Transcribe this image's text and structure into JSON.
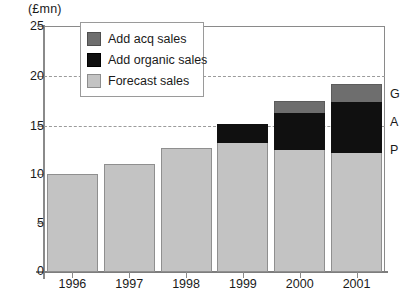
{
  "chart_data": {
    "type": "bar",
    "subtype": "stacked-bar",
    "title": "",
    "xlabel": "",
    "ylabel": "(£mn)",
    "y_unit_caption": "(£mn)",
    "categories": [
      "1996",
      "1997",
      "1998",
      "1999",
      "2000",
      "2001"
    ],
    "series": [
      {
        "name": "Forecast sales",
        "values": [
          10.0,
          11.0,
          12.6,
          13.1,
          12.4,
          12.1
        ],
        "color": "#c3c3c3"
      },
      {
        "name": "Add organic sales",
        "values": [
          0,
          0,
          0,
          1.9,
          3.8,
          5.2
        ],
        "color": "#101010"
      },
      {
        "name": "Add acq sales",
        "values": [
          0,
          0,
          0,
          0,
          1.2,
          1.8
        ],
        "color": "#6e6e6e"
      }
    ],
    "totals": [
      10.0,
      11.0,
      12.6,
      15.0,
      17.4,
      19.1
    ],
    "ylim": [
      0,
      25
    ],
    "yticks": [
      0,
      5,
      10,
      15,
      20,
      25
    ],
    "ytick_labels": [
      "0",
      "5",
      "10",
      "15",
      "20",
      "25"
    ],
    "gridlines_at": [
      15,
      20
    ],
    "grid": "dashed-horizontal-partial",
    "legend_position": "top-left-inside",
    "annotations": [
      {
        "text": "G",
        "value": 19.1,
        "note": "gap bracket letter"
      },
      {
        "text": "A",
        "value": 17.4,
        "note": "gap bracket letter"
      },
      {
        "text": "P",
        "value": 15.5,
        "note": "gap bracket letter"
      }
    ]
  },
  "legend": {
    "items": [
      {
        "label": "Add acq sales",
        "swatch": "dark-gray-swatch"
      },
      {
        "label": "Add organic sales",
        "swatch": "black-swatch"
      },
      {
        "label": "Forecast sales",
        "swatch": "light-gray-swatch"
      }
    ]
  },
  "axes": {
    "y_caption": "(£mn)",
    "y_ticks": [
      "25",
      "20",
      "15",
      "10",
      "5",
      "0"
    ],
    "x_ticks": [
      "1996",
      "1997",
      "1998",
      "1999",
      "2000",
      "2001"
    ]
  },
  "gap_annotation": {
    "letters": [
      "G",
      "A",
      "P"
    ]
  }
}
